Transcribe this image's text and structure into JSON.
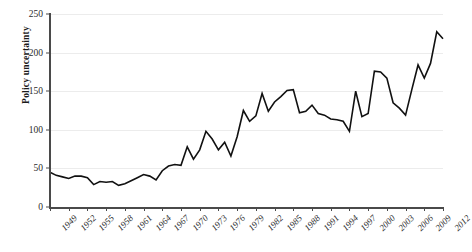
{
  "chart_data": {
    "type": "line",
    "title": "",
    "subtitle": "",
    "xlabel": "",
    "ylabel": "Policy uncertainty",
    "xlim": [
      1949,
      2012
    ],
    "ylim": [
      0,
      250
    ],
    "yticks": [
      0,
      50,
      100,
      150,
      200,
      250
    ],
    "xticks": [
      1949,
      1952,
      1955,
      1958,
      1961,
      1964,
      1967,
      1970,
      1973,
      1976,
      1979,
      1982,
      1985,
      1988,
      1991,
      1994,
      1997,
      2000,
      2003,
      2006,
      2009,
      2012
    ],
    "grid": "horizontal",
    "legend": "none",
    "series": [
      {
        "name": "Policy uncertainty",
        "color": "#111111",
        "x": [
          1949,
          1950,
          1951,
          1952,
          1953,
          1954,
          1955,
          1956,
          1957,
          1958,
          1959,
          1960,
          1961,
          1962,
          1963,
          1964,
          1965,
          1966,
          1967,
          1968,
          1969,
          1970,
          1971,
          1972,
          1973,
          1974,
          1975,
          1976,
          1977,
          1978,
          1979,
          1980,
          1981,
          1982,
          1983,
          1984,
          1985,
          1986,
          1987,
          1988,
          1989,
          1990,
          1991,
          1992,
          1993,
          1994,
          1995,
          1996,
          1997,
          1998,
          1999,
          2000,
          2001,
          2002,
          2003,
          2004,
          2005,
          2006,
          2007,
          2008,
          2009,
          2010,
          2011,
          2012
        ],
        "values": [
          45,
          41,
          39,
          37,
          40,
          40,
          38,
          29,
          33,
          32,
          33,
          28,
          30,
          34,
          38,
          42,
          40,
          35,
          47,
          53,
          55,
          54,
          78,
          62,
          74,
          98,
          88,
          74,
          84,
          66,
          91,
          125,
          111,
          118,
          147,
          124,
          136,
          143,
          151,
          152,
          122,
          124,
          132,
          121,
          119,
          114,
          113,
          111,
          98,
          150,
          117,
          121,
          176,
          175,
          167,
          135,
          128,
          119,
          152,
          184,
          167,
          186,
          227,
          218
        ]
      }
    ]
  }
}
